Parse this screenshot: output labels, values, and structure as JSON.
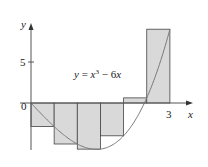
{
  "chart_data": {
    "type": "bar",
    "subtype": "riemann-sum-right-endpoints",
    "title": "",
    "function_label": "y = x³ − 6x",
    "function_label_parts": {
      "lhs": "y",
      "eq": " = ",
      "x": "x",
      "exp": "3",
      "rest": " − 6",
      "x2": "x"
    },
    "xlabel": "x",
    "ylabel": "y",
    "xlim": [
      0,
      3.4
    ],
    "ylim": [
      -6,
      9.5
    ],
    "x_ticks": [
      {
        "value": 0,
        "label": "0"
      },
      {
        "value": 3,
        "label": "3"
      }
    ],
    "y_ticks": [
      {
        "value": 5,
        "label": "5"
      }
    ],
    "grid": false,
    "legend": "none",
    "categories": [
      "[0,0.5]",
      "[0.5,1]",
      "[1,1.5]",
      "[1.5,2]",
      "[2,2.5]",
      "[2.5,3]"
    ],
    "x_left": [
      0,
      0.5,
      1,
      1.5,
      2,
      2.5
    ],
    "width": 0.5,
    "values": [
      -2.875,
      -5,
      -5.625,
      -4,
      0.625,
      9
    ],
    "curve": {
      "expr": "x^3 - 6x",
      "domain": [
        0,
        3
      ]
    },
    "colors": {
      "bar_fill": "#d9d9d9",
      "bar_stroke": "#444444",
      "curve": "#7a7a7a",
      "axis": "#555555"
    }
  }
}
